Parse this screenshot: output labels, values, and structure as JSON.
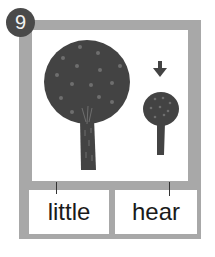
{
  "card": {
    "number": "9",
    "labels": [
      "little",
      "hear"
    ],
    "colors": {
      "frame": "#a8a8a8",
      "tree": "#434343",
      "badge": "#4a4a4a",
      "dots": "#6e6e6e"
    },
    "icons": [
      "big-tree-icon",
      "small-tree-icon",
      "arrow-down-icon"
    ]
  }
}
